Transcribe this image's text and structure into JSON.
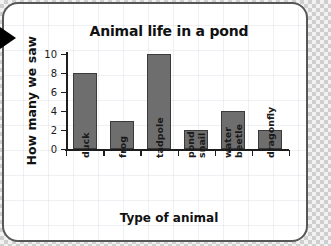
{
  "card": {
    "border_color": "#575757",
    "background": "#ffffff"
  },
  "pointer": {
    "icon": "play-triangle-icon"
  },
  "chart_data": {
    "type": "bar",
    "title": "Animal life in a pond",
    "xlabel": "Type of animal",
    "ylabel": "How many we saw",
    "categories": [
      "duck",
      "frog",
      "tadpole",
      "pond snail",
      "water beetle",
      "dragonfly"
    ],
    "values": [
      8,
      3,
      10,
      2,
      4,
      2
    ],
    "ylim": [
      0,
      10
    ],
    "yticks": [
      0,
      2,
      4,
      6,
      8,
      10
    ],
    "ytick_labels": [
      "0",
      "2",
      "4",
      "6",
      "8",
      "10"
    ],
    "grid": false,
    "legend": null,
    "bar_color": "#6e6e6e",
    "bar_edge_color": "#3a3a3a",
    "axis_color": "#1d1d1d",
    "category_label_rotation": 90
  }
}
